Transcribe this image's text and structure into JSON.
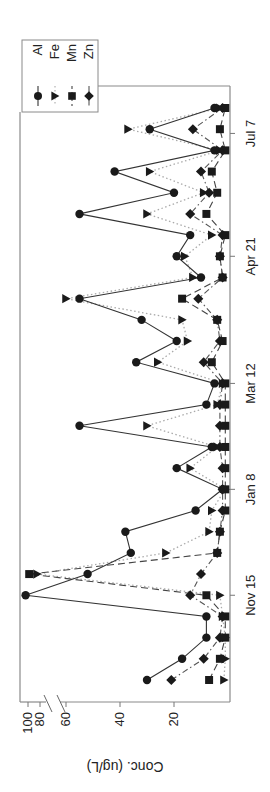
{
  "chart_data": {
    "type": "line",
    "orientation": "rotated-90-ccw",
    "title": "",
    "xlabel": "",
    "ylabel": "Conc. (ug/L)",
    "x_tick_labels": [
      "Nov 15",
      "Jan 8",
      "Mar 12",
      "Apr 21",
      "Jul 7"
    ],
    "x_tick_index": [
      4.0,
      9.0,
      14.0,
      20.0,
      25.8
    ],
    "y_ticks": [
      20,
      40,
      60,
      80,
      100
    ],
    "y_axis_break": [
      60,
      80
    ],
    "ylim": [
      0,
      105
    ],
    "grid": false,
    "legend_position": "upper-left (rotated frame: top-right)",
    "n_samples": 28,
    "series": [
      {
        "name": "Al",
        "marker": "circle",
        "line": "solid",
        "values": [
          30,
          17,
          8,
          8,
          104,
          52,
          36,
          38,
          12,
          2,
          19,
          6,
          55,
          8,
          5,
          34,
          19,
          32,
          55,
          10,
          19,
          14,
          55,
          20,
          42,
          5,
          29,
          5
        ]
      },
      {
        "name": "Fe",
        "marker": "triangle",
        "line": "dotted",
        "values": [
          1.5,
          1,
          1,
          2,
          3,
          85,
          23,
          7,
          6,
          1,
          14,
          4,
          30,
          4,
          2,
          26,
          15,
          17,
          60,
          13,
          16,
          6,
          30,
          9,
          29,
          3,
          37,
          3
        ]
      },
      {
        "name": "Mn",
        "marker": "square",
        "line": "dashed",
        "values": [
          7,
          3,
          1,
          1,
          8,
          98,
          4,
          3,
          1,
          1,
          1,
          1,
          1,
          1,
          1,
          6,
          2,
          4,
          17,
          2,
          3,
          1,
          8,
          4,
          6,
          1,
          3,
          1
        ]
      },
      {
        "name": "Zn",
        "marker": "diamond",
        "line": "dash-dot",
        "values": [
          21,
          9,
          3,
          2,
          14,
          10,
          4,
          3,
          2,
          2,
          2,
          3,
          3,
          3,
          2,
          9,
          3,
          4,
          11,
          2,
          3,
          2,
          14,
          7,
          10,
          2,
          13,
          2
        ]
      }
    ]
  },
  "legend": {
    "items": [
      {
        "label": "Al"
      },
      {
        "label": "Fe"
      },
      {
        "label": "Mn"
      },
      {
        "label": "Zn"
      }
    ]
  },
  "axis": {
    "y_title": "Conc. (ug/L)",
    "y_tick_text": [
      "100",
      "80",
      "60",
      "40",
      "20"
    ],
    "x_tick_text": [
      "Nov 15",
      "Jan 8",
      "Mar 12",
      "Apr 21",
      "Jul 7"
    ]
  },
  "colors": {
    "ink": "#1a1a1a",
    "frame": "#888888",
    "background": "#ffffff"
  }
}
